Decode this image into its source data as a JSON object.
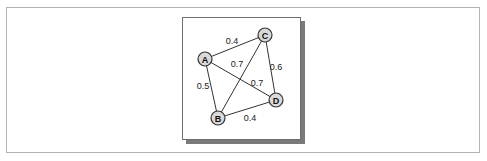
{
  "diagram": {
    "type": "weighted-undirected-graph",
    "nodes": [
      {
        "id": "A",
        "label": "A",
        "x": 205,
        "y": 59
      },
      {
        "id": "B",
        "label": "B",
        "x": 218,
        "y": 118
      },
      {
        "id": "C",
        "label": "C",
        "x": 265,
        "y": 35
      },
      {
        "id": "D",
        "label": "D",
        "x": 276,
        "y": 100
      }
    ],
    "edges": [
      {
        "from": "A",
        "to": "C",
        "weight": "0.4",
        "label_x": 232,
        "label_y": 41
      },
      {
        "from": "A",
        "to": "B",
        "weight": "0.5",
        "label_x": 203,
        "label_y": 86
      },
      {
        "from": "A",
        "to": "D",
        "weight": "0.7",
        "label_x": 257,
        "label_y": 83
      },
      {
        "from": "B",
        "to": "C",
        "weight": "0.7",
        "label_x": 237,
        "label_y": 64
      },
      {
        "from": "C",
        "to": "D",
        "weight": "0.6",
        "label_x": 276,
        "label_y": 67
      },
      {
        "from": "B",
        "to": "D",
        "weight": "0.4",
        "label_x": 250,
        "label_y": 118
      }
    ]
  },
  "colors": {
    "node_fill": "#d9d9d9",
    "stroke": "#333333",
    "frame_border": "#b5b5b5",
    "shadow": "#7a7a7a"
  }
}
